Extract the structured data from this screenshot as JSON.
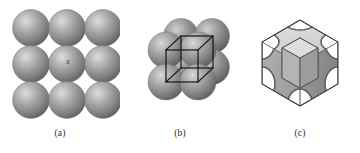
{
  "figure": {
    "background_color": "#ffffff",
    "panel_count": 3
  },
  "palette": {
    "sphere_base": "#8a8a8a",
    "sphere_highlight": "#d2d2d2",
    "sphere_mid": "#9b9b9b",
    "sphere_shadow": "#5d5d5d",
    "sphere_edge": "#6e6e6e",
    "cube_wire": "#111111",
    "cell_top_face": "#d8d8d8",
    "cell_left_face": "#a6a6a6",
    "cell_right_face": "#8f8f8f",
    "cell_cavity": "#6f6f6f",
    "cell_cavity_light": "#b9b9b9",
    "cell_outline": "#4a4a4a",
    "caption_color": "#2a2a2a",
    "label_color": "#2b2b2b"
  },
  "panels": [
    {
      "id": "a",
      "caption": "(a)",
      "kind": "sphere-array",
      "description": "Three by three array of touching hard spheres",
      "rows": 3,
      "columns": 3,
      "sphere_count": 9,
      "sphere_diameter_px": 36,
      "center_label": "x",
      "center_label_style": "italic"
    },
    {
      "id": "b",
      "caption": "(b)",
      "kind": "unit-cell-spheres-with-wireframe",
      "description": "Eight corner spheres with wireframe cube showing the unit cell",
      "sphere_count": 8,
      "wireframe": "cube",
      "wireframe_color": "#111111"
    },
    {
      "id": "c",
      "caption": "(c)",
      "kind": "solid-unit-cell",
      "description": "Solid isometric cube with concave sphere sections carved at the corners",
      "faces_visible": 3,
      "corner_cavities": 8
    }
  ],
  "captions": {
    "a": "(a)",
    "b": "(b)",
    "c": "(c)"
  }
}
